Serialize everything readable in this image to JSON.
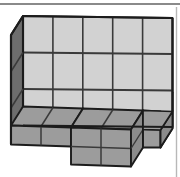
{
  "figure": {
    "kind": "isometric-block-solid-diagram",
    "title": "",
    "caption": "",
    "labels": [],
    "canvas": {
      "width": 180,
      "height": 177,
      "background": "#ffffff"
    },
    "palette": {
      "face_front": "#d2d2d2",
      "face_top_dark": "#9c9c9c",
      "face_side_dark": "#6d6d6d",
      "face_right_dark": "#8c8c8c",
      "outline": "#1c1c1c",
      "gridline": "#3a3a3a",
      "rule": "#8a8a8a",
      "background": "#ffffff"
    },
    "projection": {
      "type": "oblique",
      "cell_width": 30,
      "cell_height": 31,
      "depth_dx": -12,
      "depth_dy": 19
    },
    "structure": {
      "front_grid_columns": 5,
      "front_grid_rows": 3,
      "visible_cube_count": 15,
      "has_lower_step": true,
      "lower_step_columns": 2,
      "description": "Rectangular solid of cubes, 5 wide and 3 tall on the front face, with a lower one-cube-high ledge stepping forward at the base"
    },
    "rules": {
      "top_rule": {
        "x1": 0,
        "y1": 4,
        "x2": 180,
        "y2": 4
      },
      "right_rule": {
        "x1": 176,
        "y1": 8,
        "x2": 176,
        "y2": 177
      }
    },
    "geometry": {
      "front_face": "M23,16 L172,18 L172,127 L23,125 Z",
      "front_grid_vertical_x": [
        52.8,
        82.6,
        112.4,
        142.2
      ],
      "front_grid_horizontal_y": [
        52.5,
        89,
        125.5
      ],
      "left_side_face": "M23,16 L11,35 L11,144 L23,125 Z",
      "left_side_rungs": [
        "M11,71 L23,52.5",
        "M11,107.5 L23,89"
      ],
      "top_dark_ledge_left": "M11,125 L23,107 L83,109 L71,128 Z",
      "top_dark_ledge_left_divider": "M41,126 L53,108",
      "front_dark_band_left": "M11,125 L71,128 L71,146 L11,144 Z",
      "front_dark_band_left_divider": "M41,126 L41,145",
      "lower_step_top": "M71,128 L83,109 L143,111 L131,130 Z",
      "lower_step_front": "M71,128 L131,130 L131,167 L71,165 Z",
      "lower_step_front_divider_v": "M101,129 L101,166",
      "lower_step_front_divider_h": "M71,147 L131,149",
      "lower_step_right": "M131,130 L143,111 L143,148 L131,167 Z",
      "right_dark_notch_top": "M143,111 L155,109 L172,111 L160,130 Z",
      "right_dark_notch_front": "M143,111 L160,130 L160,148 L143,148 Z",
      "right_lower_wedge": "M160,130 L172,111 L172,128 L160,148 Z"
    }
  }
}
